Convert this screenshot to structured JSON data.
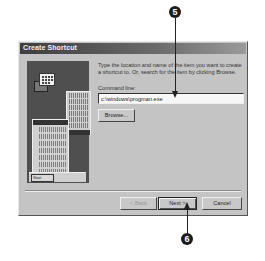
{
  "dialog": {
    "title": "Create Shortcut",
    "description": "Type the location and name of the item you want to create a shortcut to. Or, search for the item by clicking Browse.",
    "command_line": {
      "label": "Command line:",
      "value": "c:\\windows\\progman.exe"
    },
    "buttons": {
      "browse": "Browse...",
      "back": "< Back",
      "next": "Next >",
      "cancel": "Cancel"
    },
    "illustration": {
      "start_button": "Start"
    }
  },
  "callouts": [
    {
      "number": "5",
      "target": "command-line-input"
    },
    {
      "number": "6",
      "target": "next-button"
    }
  ]
}
